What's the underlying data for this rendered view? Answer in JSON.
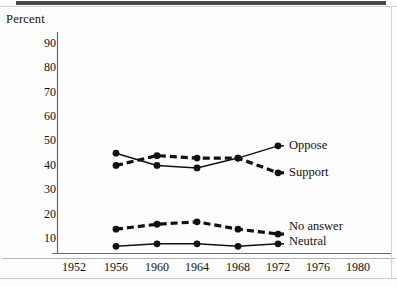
{
  "figure": {
    "y_axis_title": "Percent",
    "y_ticks": [
      "90",
      "80",
      "70",
      "60",
      "50",
      "40",
      "30",
      "20",
      "10"
    ],
    "x_ticks": [
      "1952",
      "1956",
      "1960",
      "1964",
      "1968",
      "1972",
      "1976",
      "1980"
    ],
    "series_labels": {
      "oppose": "Oppose",
      "support": "Support",
      "no_answer": "No answer",
      "neutral": "Neutral"
    },
    "colors": {
      "ink": "#111111",
      "axis": "#555555",
      "page": "#fdfdfd"
    }
  },
  "chart_data": {
    "type": "line",
    "title": "",
    "xlabel": "",
    "ylabel": "Percent",
    "xlim": [
      1950,
      1982
    ],
    "ylim": [
      0,
      95
    ],
    "x_ticks": [
      1952,
      1956,
      1960,
      1964,
      1968,
      1972,
      1976,
      1980
    ],
    "y_ticks": [
      10,
      20,
      30,
      40,
      50,
      60,
      70,
      80,
      90
    ],
    "grid": false,
    "legend": "inline-right-of-line-ends",
    "x": [
      1956,
      1960,
      1964,
      1968,
      1972
    ],
    "series": [
      {
        "name": "Oppose",
        "style": "solid",
        "marker": "filled-circle",
        "values": [
          44,
          39,
          38,
          42,
          47
        ]
      },
      {
        "name": "Support",
        "style": "dashed",
        "marker": "filled-circle",
        "values": [
          39,
          43,
          42,
          42,
          36
        ]
      },
      {
        "name": "No answer",
        "style": "dashed",
        "marker": "filled-circle",
        "values": [
          13,
          15,
          16,
          13,
          11
        ]
      },
      {
        "name": "Neutral",
        "style": "solid",
        "marker": "filled-circle",
        "values": [
          6,
          7,
          7,
          6,
          7
        ]
      }
    ]
  }
}
